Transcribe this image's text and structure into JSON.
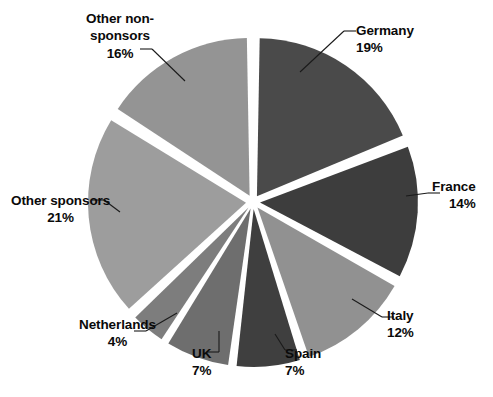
{
  "chart_data": {
    "type": "pie",
    "title": "",
    "subtitle": "",
    "xlabel": "",
    "ylabel": "",
    "legend_position": "none",
    "grid": false,
    "exploded": true,
    "units": "percent",
    "total": 100,
    "categories": [
      "Germany",
      "France",
      "Italy",
      "Spain",
      "UK",
      "Netherlands",
      "Other sponsors",
      "Other non-sponsors"
    ],
    "values": [
      19,
      14,
      12,
      7,
      7,
      4,
      21,
      16
    ],
    "slices": [
      {
        "label": "Germany",
        "value": 19,
        "value_text": "19%",
        "color": "#4a4a4a",
        "start_angle": 0,
        "end_angle": 68.4,
        "label_align": "left",
        "label_x": 356,
        "label_y": 22
      },
      {
        "label": "France",
        "value": 14,
        "value_text": "14%",
        "color": "#3d3d3d",
        "start_angle": 68.4,
        "end_angle": 118.8,
        "label_align": "right",
        "label_x": 432,
        "label_y": 178
      },
      {
        "label": "Italy",
        "value": 12,
        "value_text": "12%",
        "color": "#919191",
        "start_angle": 118.8,
        "end_angle": 162.0,
        "label_align": "left",
        "label_x": 387,
        "label_y": 307
      },
      {
        "label": "Spain",
        "value": 7,
        "value_text": "7%",
        "color": "#3f3f3f",
        "start_angle": 162.0,
        "end_angle": 187.2,
        "label_align": "left",
        "label_x": 285,
        "label_y": 345
      },
      {
        "label": "UK",
        "value": 7,
        "value_text": "7%",
        "color": "#6e6e6e",
        "start_angle": 187.2,
        "end_angle": 212.4,
        "label_align": "left",
        "label_x": 192,
        "label_y": 345
      },
      {
        "label": "Netherlands",
        "value": 4,
        "value_text": "4%",
        "color": "#7d7d7d",
        "start_angle": 212.4,
        "end_angle": 226.8,
        "label_align": "center",
        "label_x": 79,
        "label_y": 316
      },
      {
        "label": "Other sponsors",
        "value": 21,
        "value_text": "21%",
        "color": "#9d9d9d",
        "start_angle": 226.8,
        "end_angle": 302.4,
        "label_align": "center",
        "label_x": 11,
        "label_y": 192
      },
      {
        "label": "Other non-sponsors",
        "value": 16,
        "value_text": "16%",
        "color": "#949494",
        "start_angle": 302.4,
        "end_angle": 360,
        "label_align": "center",
        "label_x": 86,
        "label_y": 10
      }
    ],
    "geometry": {
      "center_x": 253,
      "center_y": 202,
      "radius": 158,
      "explode_offset": 7,
      "gap_degrees": 2.0
    },
    "leaders": [
      {
        "name": "Germany",
        "x1": 300,
        "y1": 72,
        "x2": 344,
        "y2": 31
      },
      {
        "name": "France",
        "x1": 406,
        "y1": 196,
        "x2": 428,
        "y2": 193
      },
      {
        "name": "Italy",
        "x1": 352,
        "y1": 299,
        "x2": 382,
        "y2": 317
      },
      {
        "name": "Spain",
        "x1": 275,
        "y1": 334,
        "x2": 285,
        "y2": 350
      },
      {
        "name": "UK",
        "x1": 219,
        "y1": 331,
        "x2": 219,
        "y2": 352
      },
      {
        "name": "Netherlands",
        "x1": 177,
        "y1": 313,
        "x2": 146,
        "y2": 331
      },
      {
        "name": "Other sponsors",
        "x1": 120,
        "y1": 212,
        "x2": 104,
        "y2": 200
      },
      {
        "name": "Other non-sponsors",
        "x1": 185,
        "y1": 81,
        "x2": 152,
        "y2": 49
      }
    ],
    "leader_color": "#1a1a1a",
    "background": "#ffffff",
    "text_color": "#0a0a0a"
  }
}
